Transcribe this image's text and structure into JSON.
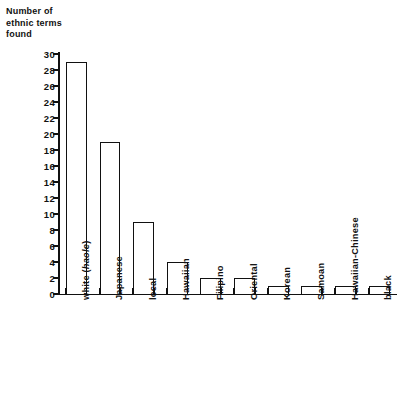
{
  "chart_data": {
    "type": "bar",
    "title": "",
    "ylabel": "Number of\nethnic terms\nfound",
    "xlabel": "",
    "ylim": [
      0,
      30
    ],
    "ytick_step": 2,
    "yticks": [
      0,
      2,
      4,
      6,
      8,
      10,
      12,
      14,
      16,
      18,
      20,
      22,
      24,
      26,
      28,
      30
    ],
    "grid": false,
    "legend": null,
    "categories": [
      "white (haole)",
      "Japanese",
      "local",
      "Hawaiian",
      "Filipino",
      "Oriental",
      "Korean",
      "Samoan",
      "Hawaiian-Chinese",
      "black"
    ],
    "category_parts": [
      {
        "plain": "white (",
        "italic": "haole",
        "tail": ")"
      },
      {
        "plain": "Japanese",
        "italic": "",
        "tail": ""
      },
      {
        "plain": "local",
        "italic": "",
        "tail": ""
      },
      {
        "plain": "Hawaiian",
        "italic": "",
        "tail": ""
      },
      {
        "plain": "Filipino",
        "italic": "",
        "tail": ""
      },
      {
        "plain": "Oriental",
        "italic": "",
        "tail": ""
      },
      {
        "plain": "Korean",
        "italic": "",
        "tail": ""
      },
      {
        "plain": "Samoan",
        "italic": "",
        "tail": ""
      },
      {
        "plain": "Hawaiian-Chinese",
        "italic": "",
        "tail": ""
      },
      {
        "plain": "black",
        "italic": "",
        "tail": ""
      }
    ],
    "values": [
      29,
      19,
      9,
      4,
      2,
      2,
      1,
      1,
      1,
      1
    ],
    "bar_facecolor": "#ffffff",
    "bar_edgecolor": "#111111",
    "axis_color": "#111111"
  },
  "caption": "",
  "colors": {
    "background": "#ffffff",
    "ink": "#111111"
  }
}
